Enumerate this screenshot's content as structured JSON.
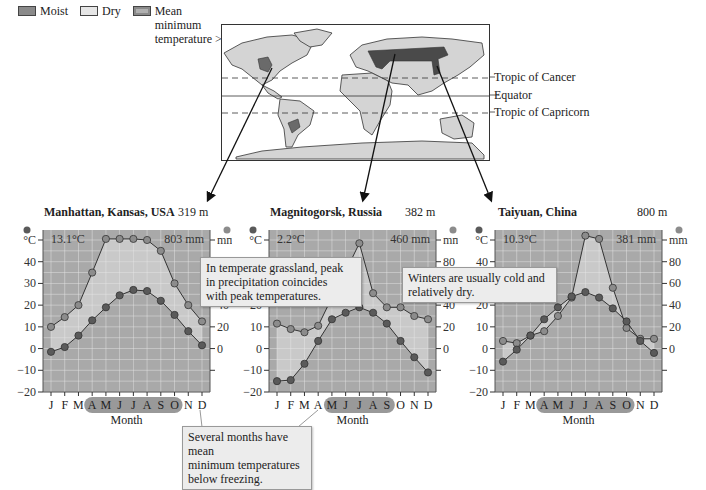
{
  "legend": {
    "items": [
      {
        "label": "Moist",
        "color": "#8a8a8a"
      },
      {
        "label": "Dry",
        "color": "#e6e6e6"
      },
      {
        "label": "Mean minimum temperature >0°C",
        "label_lines": [
          "Mean",
          "minimum",
          "temperature >0°C"
        ],
        "color": "#b0b0b0"
      }
    ]
  },
  "map": {
    "lines": [
      {
        "label": "Tropic of Cancer",
        "style": "dashed"
      },
      {
        "label": "Equator",
        "style": "solid"
      },
      {
        "label": "Tropic of Capricorn",
        "style": "dashed"
      }
    ]
  },
  "callouts": {
    "grassland": "In temperate grassland, peak in precipitation coincides with peak temperatures.",
    "grassland_lines": [
      "In temperate grassland, peak",
      "in precipitation coincides",
      "with peak temperatures."
    ],
    "winters": "Winters are usually cold and relatively dry.",
    "winters_lines": [
      "Winters are usually cold and",
      "relatively dry."
    ],
    "freezing": "Several months have mean minimum temperatures below freezing.",
    "freezing_lines": [
      "Several months have mean",
      "minimum temperatures",
      "below freezing."
    ]
  },
  "axis_labels": {
    "temp_unit": "°C",
    "precip_unit": "mm",
    "x_label": "Month"
  },
  "colors": {
    "plot_bg_dark": "#a9a9a9",
    "plot_bg_light": "#cfcfcf",
    "gridline": "#e8e8e8",
    "temp_dot": "#5a5a5a",
    "precip_dot": "#8c8c8c",
    "line": "#333333",
    "highlight_months": "#777777"
  },
  "chart_data": [
    {
      "type": "line",
      "title": "Manhattan, Kansas, USA",
      "elevation": "319 m",
      "mean_temp": "13.1°C",
      "annual_precip": "803 mm",
      "xlabel": "Month",
      "ylabel_left": "°C",
      "ylabel_right": "mm",
      "categories": [
        "J",
        "F",
        "M",
        "A",
        "M",
        "J",
        "J",
        "A",
        "S",
        "O",
        "N",
        "D"
      ],
      "highlighted_months": [
        "A",
        "M",
        "J",
        "J",
        "A",
        "S",
        "O"
      ],
      "highlight_range": [
        3,
        9
      ],
      "yticks_left": [
        -20,
        -10,
        0,
        10,
        20,
        30,
        40
      ],
      "yticks_right": [
        0,
        20,
        40
      ],
      "ylim_left": [
        -20,
        50
      ],
      "ylim_right": [
        -40,
        100
      ],
      "grid": true,
      "series": [
        {
          "name": "Temperature (°C)",
          "axis": "left",
          "values": [
            -1.5,
            0.7,
            6,
            13,
            19,
            24.5,
            27,
            26.5,
            22,
            15.5,
            8,
            1.5
          ]
        },
        {
          "name": "Precipitation (mm)",
          "axis": "right",
          "values": [
            20,
            29,
            40,
            70,
            101,
            101,
            101,
            100,
            90,
            60,
            40,
            25
          ]
        }
      ]
    },
    {
      "type": "line",
      "title": "Magnitogorsk, Russia",
      "elevation": "382 m",
      "mean_temp": "2.2°C",
      "annual_precip": "460 mm",
      "xlabel": "Month",
      "ylabel_left": "°C",
      "ylabel_right": "mm",
      "categories": [
        "J",
        "F",
        "M",
        "A",
        "M",
        "J",
        "J",
        "A",
        "S",
        "O",
        "N",
        "D"
      ],
      "highlighted_months": [
        "M",
        "J",
        "J",
        "A",
        "S"
      ],
      "highlight_range": [
        4,
        8
      ],
      "yticks_left": [
        -20,
        -10,
        0,
        10,
        20
      ],
      "yticks_right": [
        0,
        20,
        40,
        80
      ],
      "ylim_left": [
        -20,
        50
      ],
      "ylim_right": [
        -40,
        100
      ],
      "grid": true,
      "series": [
        {
          "name": "Temperature (°C)",
          "axis": "left",
          "values": [
            -15,
            -14.5,
            -7,
            3.5,
            13.5,
            16.5,
            19,
            16.5,
            11.5,
            3.5,
            -4,
            -11
          ]
        },
        {
          "name": "Precipitation (mm)",
          "axis": "right",
          "values": [
            23,
            18,
            15,
            21,
            47,
            71,
            97,
            51,
            38,
            38,
            30,
            27
          ]
        }
      ]
    },
    {
      "type": "line",
      "title": "Taiyuan, China",
      "elevation": "800 m",
      "mean_temp": "10.3°C",
      "annual_precip": "381 mm",
      "xlabel": "Month",
      "ylabel_left": "°C",
      "ylabel_right": "mm",
      "categories": [
        "J",
        "F",
        "M",
        "A",
        "M",
        "J",
        "J",
        "A",
        "S",
        "O",
        "N",
        "D"
      ],
      "highlighted_months": [
        "A",
        "M",
        "J",
        "J",
        "A",
        "S",
        "O"
      ],
      "highlight_range": [
        3,
        9
      ],
      "yticks_left": [
        -20,
        -10,
        0,
        10,
        20,
        40
      ],
      "yticks_right": [
        0,
        20,
        40,
        60,
        80
      ],
      "ylim_left": [
        -20,
        50
      ],
      "ylim_right": [
        -40,
        100
      ],
      "grid": true,
      "series": [
        {
          "name": "Temperature (°C)",
          "axis": "left",
          "values": [
            -6,
            -0.5,
            6,
            13.5,
            19,
            24,
            26,
            23.5,
            18.5,
            12.5,
            3.5,
            -2
          ]
        },
        {
          "name": "Precipitation (mm)",
          "axis": "right",
          "values": [
            7,
            5,
            12,
            16,
            30,
            47,
            104,
            101,
            56,
            19,
            9,
            9
          ]
        }
      ]
    }
  ]
}
